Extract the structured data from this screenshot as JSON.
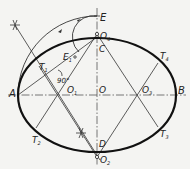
{
  "diagram": {
    "colors": {
      "background": "#f4f4f2",
      "ellipse": "#1a1a1a",
      "construction": "#3a3a3a",
      "axis": "#555555"
    },
    "labels": {
      "A": "A",
      "B": "B",
      "C": "C",
      "D": "D",
      "E": "E",
      "E1": "E",
      "E1_sub": "1",
      "O": "O",
      "O1": "O",
      "O1_sub": "1",
      "O2": "O",
      "O2_sub": "2",
      "O3": "O",
      "O3_sub": "3",
      "O4": "O",
      "O4_sub": "4",
      "T1": "T",
      "T1_sub": "1",
      "T2": "T",
      "T2_sub": "2",
      "T3": "T",
      "T3_sub": "3",
      "T4": "T",
      "T4_sub": "4",
      "angle": "90°"
    },
    "points": {
      "O": [
        97,
        95
      ],
      "A": [
        18,
        95
      ],
      "B": [
        176,
        95
      ],
      "C": [
        97,
        37
      ],
      "D": [
        97,
        150
      ],
      "E": [
        97,
        14
      ],
      "E1": [
        72,
        60
      ],
      "O1": [
        62,
        95
      ],
      "O2": [
        97,
        157
      ],
      "O3": [
        135,
        95
      ],
      "O4": [
        97,
        34
      ],
      "T1": [
        39,
        66
      ],
      "T2": [
        36,
        128
      ],
      "T3": [
        158,
        127
      ],
      "T4": [
        158,
        63
      ]
    }
  }
}
